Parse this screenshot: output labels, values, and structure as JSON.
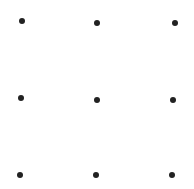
{
  "diagram": {
    "type": "dot-grid",
    "rows": 3,
    "columns": 3,
    "dot_color": "#222222",
    "dot_diameter": 6,
    "background": "#ffffff",
    "dots": [
      {
        "row": 1,
        "col": 1,
        "x": 22,
        "y": 21
      },
      {
        "row": 1,
        "col": 2,
        "x": 97,
        "y": 23
      },
      {
        "row": 1,
        "col": 3,
        "x": 175,
        "y": 23
      },
      {
        "row": 2,
        "col": 1,
        "x": 21,
        "y": 98
      },
      {
        "row": 2,
        "col": 2,
        "x": 97,
        "y": 100
      },
      {
        "row": 2,
        "col": 3,
        "x": 173,
        "y": 100
      },
      {
        "row": 3,
        "col": 1,
        "x": 20,
        "y": 175
      },
      {
        "row": 3,
        "col": 2,
        "x": 96,
        "y": 175
      },
      {
        "row": 3,
        "col": 3,
        "x": 172,
        "y": 175
      }
    ]
  }
}
